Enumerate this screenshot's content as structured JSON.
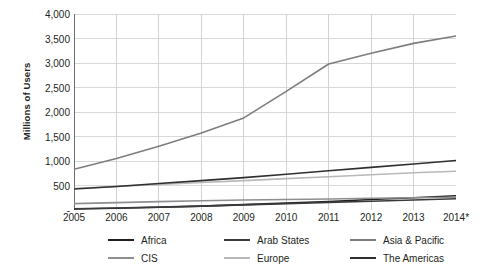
{
  "chart_data": {
    "type": "line",
    "title": "",
    "xlabel": "",
    "ylabel": "Millions of Users",
    "x": [
      "2005",
      "2006",
      "2007",
      "2008",
      "2009",
      "2010",
      "2011",
      "2012",
      "2013",
      "2014*"
    ],
    "xlim": [
      2005,
      2014
    ],
    "ylim": [
      0,
      4000
    ],
    "ytick_labels": [
      "-",
      "500",
      "1,000",
      "1,500",
      "2,000",
      "2,500",
      "3,000",
      "3,500",
      "4,000"
    ],
    "ytick_values": [
      0,
      500,
      1000,
      1500,
      2000,
      2500,
      3000,
      3500,
      4000
    ],
    "grid": true,
    "legend_position": "bottom",
    "series": [
      {
        "name": "Africa",
        "color": "#231f20",
        "values": [
          20,
          35,
          55,
          80,
          110,
          140,
          175,
          215,
          250,
          290
        ]
      },
      {
        "name": "Arab States",
        "color": "#3a3a3c",
        "values": [
          25,
          40,
          58,
          80,
          105,
          130,
          155,
          180,
          205,
          230
        ]
      },
      {
        "name": "Asia & Pacific",
        "color": "#7d7d80",
        "values": [
          830,
          1050,
          1300,
          1570,
          1880,
          2420,
          2980,
          3200,
          3400,
          3550
        ]
      },
      {
        "name": "CIS",
        "color": "#8e8e92",
        "values": [
          130,
          150,
          170,
          190,
          205,
          215,
          225,
          240,
          250,
          260
        ]
      },
      {
        "name": "Europe",
        "color": "#b8b8bb",
        "values": [
          440,
          480,
          520,
          560,
          600,
          640,
          680,
          720,
          760,
          790
        ]
      },
      {
        "name": "The Americas",
        "color": "#2f2f31",
        "values": [
          430,
          480,
          540,
          600,
          660,
          730,
          800,
          870,
          940,
          1010
        ]
      }
    ]
  }
}
